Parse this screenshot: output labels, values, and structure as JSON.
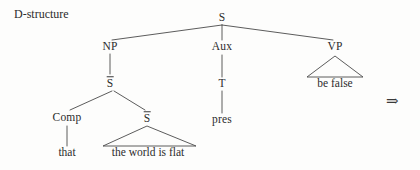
{
  "diagram": {
    "caption": "D-structure",
    "arrow_glyph": "⇒",
    "line_color": "#4a4a4a",
    "text_color": "#2c2c2c",
    "background_color": "#fdfdfc",
    "width": 420,
    "height": 170
  },
  "nodes": [
    {
      "id": "root-s",
      "label": "S",
      "x": 222,
      "y": 18,
      "barred": false
    },
    {
      "id": "np",
      "label": "NP",
      "x": 110,
      "y": 47,
      "barred": false
    },
    {
      "id": "aux",
      "label": "Aux",
      "x": 222,
      "y": 47,
      "barred": false
    },
    {
      "id": "vp",
      "label": "VP",
      "x": 335,
      "y": 47,
      "barred": false
    },
    {
      "id": "sbar-upper",
      "label": "S",
      "x": 110,
      "y": 83,
      "barred": true
    },
    {
      "id": "t",
      "label": "T",
      "x": 222,
      "y": 84,
      "barred": false
    },
    {
      "id": "comp",
      "label": "Comp",
      "x": 67,
      "y": 118,
      "barred": false
    },
    {
      "id": "sbar-lower",
      "label": "S",
      "x": 147,
      "y": 118,
      "barred": true
    },
    {
      "id": "pres",
      "label": "pres",
      "x": 222,
      "y": 120,
      "barred": false
    }
  ],
  "terminals": [
    {
      "id": "be-false",
      "label": "be false",
      "x": 335,
      "y": 84
    },
    {
      "id": "that",
      "label": "that",
      "x": 67,
      "y": 153
    },
    {
      "id": "the-world-is-flat",
      "label": "the world is flat",
      "x": 148,
      "y": 153
    }
  ],
  "branches": [
    {
      "id": "root-to-np",
      "x1": 222,
      "y1": 25,
      "x2": 112,
      "y2": 40
    },
    {
      "id": "root-to-aux",
      "x1": 222,
      "y1": 25,
      "x2": 222,
      "y2": 40
    },
    {
      "id": "root-to-vp",
      "x1": 222,
      "y1": 25,
      "x2": 333,
      "y2": 40
    },
    {
      "id": "np-to-sbar",
      "x1": 110,
      "y1": 54,
      "x2": 110,
      "y2": 74
    },
    {
      "id": "aux-to-t",
      "x1": 222,
      "y1": 55,
      "x2": 222,
      "y2": 77
    },
    {
      "id": "t-to-pres",
      "x1": 222,
      "y1": 91,
      "x2": 222,
      "y2": 113
    },
    {
      "id": "sbar-to-comp",
      "x1": 112,
      "y1": 91,
      "x2": 70,
      "y2": 110
    },
    {
      "id": "sbar-to-s",
      "x1": 114,
      "y1": 91,
      "x2": 145,
      "y2": 110
    },
    {
      "id": "comp-to-that",
      "x1": 67,
      "y1": 126,
      "x2": 67,
      "y2": 146
    }
  ],
  "triangles": [
    {
      "id": "vp-triangle",
      "apex_x": 335,
      "apex_y": 56,
      "left_x": 307,
      "right_x": 363,
      "base_y": 77
    },
    {
      "id": "sbar-triangle",
      "apex_x": 147,
      "apex_y": 126,
      "left_x": 103,
      "right_x": 196,
      "base_y": 146
    }
  ]
}
